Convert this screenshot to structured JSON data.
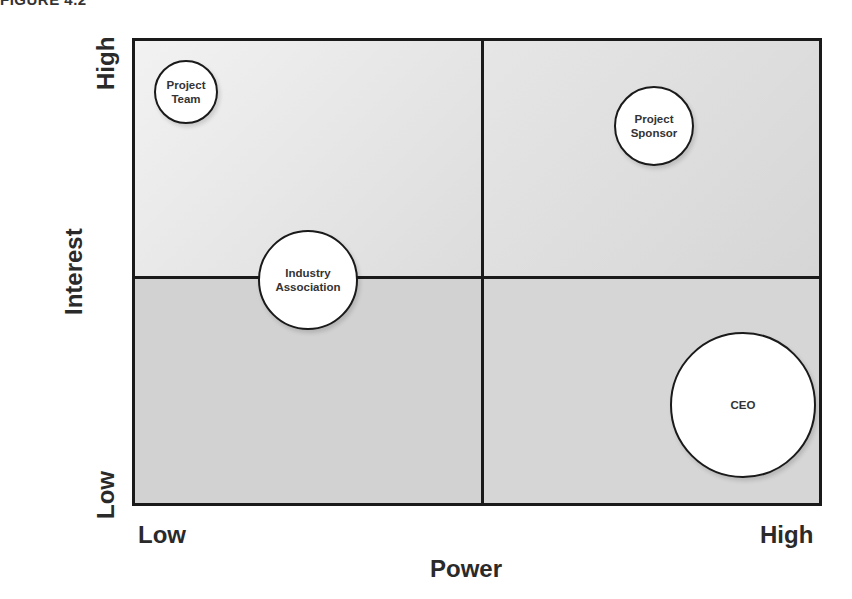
{
  "figure_label": "FIGURE 4.2",
  "grid": {
    "quadrants": [
      "high-interest-low-power",
      "high-interest-high-power",
      "low-interest-low-power",
      "low-interest-high-power"
    ]
  },
  "axes": {
    "x": {
      "title": "Power",
      "low": "Low",
      "high": "High"
    },
    "y": {
      "title": "Interest",
      "low": "Low",
      "high": "High"
    }
  },
  "stakeholders": [
    {
      "label_line1": "Project",
      "label_line2": "Team",
      "power": "low",
      "interest": "high"
    },
    {
      "label_line1": "Project",
      "label_line2": "Sponsor",
      "power": "high",
      "interest": "high"
    },
    {
      "label_line1": "Industry",
      "label_line2": "Association",
      "power": "low-medium",
      "interest": "medium"
    },
    {
      "label_line1": "CEO",
      "label_line2": "",
      "power": "high",
      "interest": "low"
    }
  ]
}
